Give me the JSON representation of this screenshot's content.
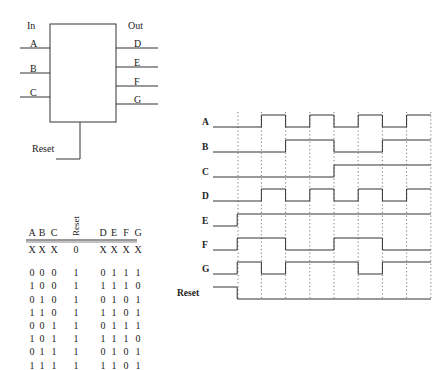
{
  "block": {
    "in_label": "In",
    "out_label": "Out",
    "inputs": [
      "A",
      "B",
      "C"
    ],
    "outputs": [
      "D",
      "E",
      "F",
      "G"
    ],
    "reset_label": "Reset"
  },
  "truth_table": {
    "headers": [
      "A",
      "B",
      "C",
      "Reset",
      "D",
      "E",
      "F",
      "G"
    ],
    "rows": [
      [
        "X",
        "X",
        "X",
        "0",
        "X",
        "X",
        "X",
        "X"
      ],
      [
        "0",
        "0",
        "0",
        "1",
        "0",
        "1",
        "1",
        "1"
      ],
      [
        "1",
        "0",
        "0",
        "1",
        "1",
        "1",
        "1",
        "0"
      ],
      [
        "0",
        "1",
        "0",
        "1",
        "0",
        "1",
        "0",
        "1"
      ],
      [
        "1",
        "1",
        "0",
        "1",
        "1",
        "1",
        "0",
        "1"
      ],
      [
        "0",
        "0",
        "1",
        "1",
        "0",
        "1",
        "1",
        "1"
      ],
      [
        "1",
        "0",
        "1",
        "1",
        "1",
        "1",
        "1",
        "0"
      ],
      [
        "0",
        "1",
        "1",
        "1",
        "0",
        "1",
        "0",
        "1"
      ],
      [
        "1",
        "1",
        "1",
        "1",
        "1",
        "1",
        "0",
        "1"
      ]
    ]
  },
  "timing": {
    "signals": [
      {
        "name": "A",
        "levels": [
          0,
          0,
          1,
          0,
          1,
          0,
          1,
          0,
          1
        ]
      },
      {
        "name": "B",
        "levels": [
          0,
          0,
          0,
          1,
          1,
          0,
          0,
          1,
          1
        ]
      },
      {
        "name": "C",
        "levels": [
          0,
          0,
          0,
          0,
          0,
          1,
          1,
          1,
          1
        ]
      },
      {
        "name": "D",
        "levels": [
          0,
          0,
          1,
          0,
          1,
          0,
          1,
          0,
          1
        ]
      },
      {
        "name": "E",
        "levels": [
          0,
          1,
          1,
          1,
          1,
          1,
          1,
          1,
          1
        ]
      },
      {
        "name": "F",
        "levels": [
          0,
          1,
          1,
          0,
          0,
          1,
          1,
          0,
          0
        ]
      },
      {
        "name": "G",
        "levels": [
          0,
          1,
          0,
          1,
          1,
          1,
          0,
          1,
          1
        ]
      },
      {
        "name": "Reset",
        "levels": [
          1,
          0,
          0,
          0,
          0,
          0,
          0,
          0,
          0
        ]
      }
    ],
    "time_divisions": 9
  }
}
